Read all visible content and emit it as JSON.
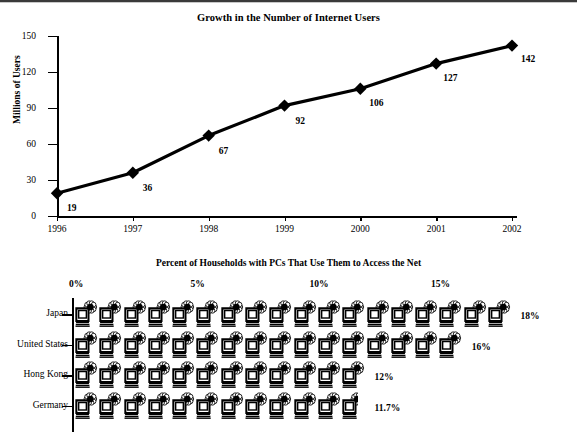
{
  "chart_data": [
    {
      "type": "line",
      "title": "Growth in the Number of Internet Users",
      "xlabel": "",
      "ylabel": "Millions of Users",
      "categories": [
        "1996",
        "1997",
        "1998",
        "1999",
        "2000",
        "2001",
        "2002"
      ],
      "values": [
        19,
        36,
        67,
        92,
        106,
        127,
        142
      ],
      "point_labels": [
        "19",
        "36",
        "67",
        "92",
        "106",
        "127",
        "142"
      ],
      "ylim": [
        0,
        150
      ],
      "yticks": [
        0,
        30,
        60,
        90,
        120,
        150
      ],
      "ytick_labels": [
        "0",
        "30",
        "60",
        "90",
        "120",
        "150"
      ],
      "grid": false,
      "legend": "none",
      "marker": "diamond",
      "line_color": "#000000"
    },
    {
      "type": "bar",
      "subtype": "pictogram",
      "title": "Percent of Households with PCs That Use Them to Access the Net",
      "xlabel": "",
      "ylabel": "",
      "categories": [
        "Japan",
        "United States",
        "Hong Kong",
        "Germany"
      ],
      "values": [
        18,
        16,
        12,
        11.7
      ],
      "value_labels": [
        "18%",
        "16%",
        "12%",
        "11.7%"
      ],
      "xticks": [
        0,
        5,
        10,
        15
      ],
      "xtick_labels": [
        "0%",
        "5%",
        "10%",
        "15%"
      ],
      "xlim": [
        0,
        18
      ],
      "grid": false,
      "legend": "none",
      "icon": "computer-icon",
      "icon_unit_value": 1,
      "icon_unit_label": "1%"
    }
  ],
  "line_chart": {
    "title": "Growth in the Number of Internet Users",
    "y_axis_title": "Millions of Users",
    "y_ticks": [
      "150",
      "120",
      "90",
      "60",
      "30",
      "0"
    ],
    "x_ticks": [
      "1996",
      "1997",
      "1998",
      "1999",
      "2000",
      "2001",
      "2002"
    ],
    "points": [
      {
        "x": "1996",
        "y": 19,
        "label": "19"
      },
      {
        "x": "1997",
        "y": 36,
        "label": "36"
      },
      {
        "x": "1998",
        "y": 67,
        "label": "67"
      },
      {
        "x": "1999",
        "y": 92,
        "label": "92"
      },
      {
        "x": "2000",
        "y": 106,
        "label": "106"
      },
      {
        "x": "2001",
        "y": 127,
        "label": "127"
      },
      {
        "x": "2002",
        "y": 142,
        "label": "142"
      }
    ]
  },
  "picto_chart": {
    "title": "Percent of Households with PCs That Use Them to Access the Net",
    "scale_labels": [
      "0%",
      "5%",
      "10%",
      "15%"
    ],
    "rows": [
      {
        "label": "Japan",
        "value": 18,
        "value_label": "18%",
        "icons": 18
      },
      {
        "label": "United States",
        "value": 16,
        "value_label": "16%",
        "icons": 16
      },
      {
        "label": "Hong Kong",
        "value": 12,
        "value_label": "12%",
        "icons": 12
      },
      {
        "label": "Germany",
        "value": 11.7,
        "value_label": "11.7%",
        "icons": 11.7
      }
    ]
  },
  "colors": {
    "ink": "#000000",
    "rule": "#3a3a3a",
    "background": "#ffffff"
  }
}
